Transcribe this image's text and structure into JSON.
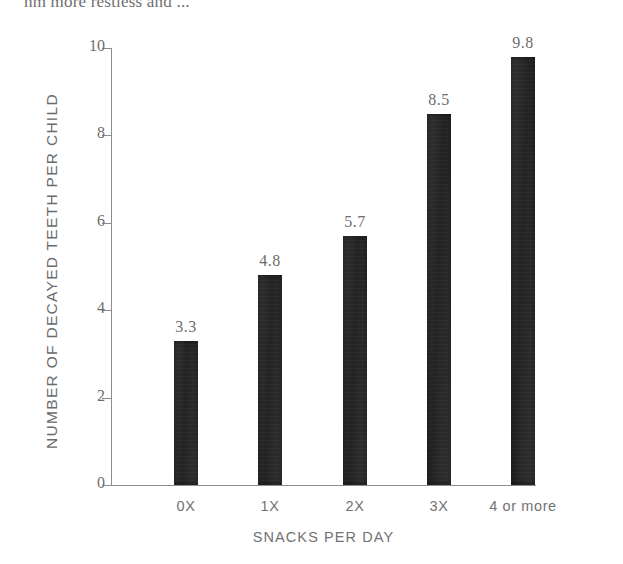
{
  "page": {
    "partial_header_text": "hm more restless and ..."
  },
  "chart_data": {
    "type": "bar",
    "title": "",
    "categories": [
      "0X",
      "1X",
      "2X",
      "3X",
      "4 or more"
    ],
    "values": [
      3.3,
      4.8,
      5.7,
      8.5,
      9.8
    ],
    "value_labels": [
      "3.3",
      "4.8",
      "5.7",
      "8.5",
      "9.8"
    ],
    "xlabel": "SNACKS PER DAY",
    "ylabel": "NUMBER OF DECAYED TEETH PER CHILD",
    "ylim": [
      0,
      10
    ],
    "yticks": [
      0,
      2,
      4,
      6,
      8,
      10
    ],
    "ytick_labels": [
      "0",
      "2",
      "4",
      "6",
      "8",
      "10"
    ],
    "grid": false,
    "legend": false,
    "bar_color": "#2b2b2b",
    "axis_color": "#8d8d8d",
    "text_color": "#6d6d6d"
  }
}
